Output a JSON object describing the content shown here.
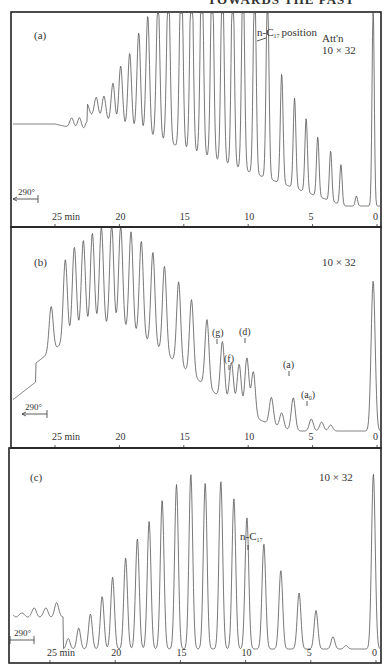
{
  "header": {
    "running_title": "TOWARDS THE PAST"
  },
  "chart_data": [
    {
      "type": "line",
      "panel": "(a)",
      "title": "",
      "xlabel": "min",
      "ylabel": "",
      "x_direction": "reversed",
      "xlim": [
        28,
        0
      ],
      "x_ticks": [
        25,
        20,
        15,
        10,
        5,
        0
      ],
      "x_tick_labels": [
        "25 min",
        "20",
        "15",
        "10",
        "5",
        "0"
      ],
      "grid": false,
      "annotations": [
        {
          "text": "n-C17 position",
          "x_min": 9.5
        },
        {
          "text": "Att'n",
          "role": "attenuation-label"
        },
        {
          "text": "10 × 32",
          "role": "attenuation"
        },
        {
          "text": "290°",
          "role": "temperature-hold-arrow"
        }
      ],
      "baseline_start": 0.55,
      "peaks_min": [
        23.7,
        23.1,
        22.5,
        21.8,
        21.2,
        20.5,
        19.9,
        19.2,
        18.5,
        17.8,
        17.0,
        16.2,
        15.2,
        14.4,
        13.6,
        12.8,
        12.0,
        11.2,
        10.4,
        9.5,
        8.5,
        7.4,
        6.4,
        5.5,
        4.6,
        3.6,
        2.8,
        1.6,
        0.3
      ],
      "peak_heights_norm": [
        0.05,
        0.06,
        0.05,
        0.1,
        0.12,
        0.2,
        0.3,
        0.38,
        0.5,
        0.6,
        0.72,
        0.82,
        1.0,
        1.0,
        1.0,
        1.0,
        1.0,
        1.0,
        1.0,
        1.0,
        0.95,
        0.55,
        0.45,
        0.37,
        0.3,
        0.25,
        0.2,
        0.05,
        1.0
      ]
    },
    {
      "type": "line",
      "panel": "(b)",
      "xlabel": "min",
      "x_direction": "reversed",
      "xlim": [
        28,
        0
      ],
      "x_ticks": [
        25,
        20,
        15,
        10,
        5,
        0
      ],
      "x_tick_labels": [
        "25 min",
        "20",
        "15",
        "10",
        "5",
        "0"
      ],
      "grid": false,
      "annotations": [
        {
          "text": "10 × 32",
          "role": "attenuation"
        },
        {
          "text": "(g)",
          "x_min": 12.0
        },
        {
          "text": "(f)",
          "x_min": 11.3
        },
        {
          "text": "(d)",
          "x_min": 10.1
        },
        {
          "text": "(a)",
          "x_min": 6.5
        },
        {
          "text": "(a0)",
          "x_min": 5.1
        },
        {
          "text": "290°",
          "role": "temperature-hold-arrow"
        }
      ],
      "envelope": "broad unresolved hump peaking ~20–21 min, declining toward 0",
      "peaks_min": [
        25.3,
        24.2,
        23.5,
        22.8,
        22.1,
        21.4,
        20.6,
        19.9,
        19.1,
        18.3,
        17.4,
        16.5,
        15.4,
        14.4,
        13.2,
        12.0,
        11.3,
        10.7,
        10.1,
        9.6,
        8.2,
        7.4,
        6.5,
        5.1,
        4.3,
        3.6,
        0.3
      ],
      "peak_heights_norm": [
        0.3,
        0.55,
        0.6,
        0.62,
        0.65,
        0.68,
        0.7,
        0.7,
        0.68,
        0.65,
        0.62,
        0.58,
        0.55,
        0.5,
        0.45,
        0.38,
        0.28,
        0.3,
        0.37,
        0.3,
        0.18,
        0.1,
        0.22,
        0.08,
        0.06,
        0.04,
        1.0
      ]
    },
    {
      "type": "line",
      "panel": "(c)",
      "xlabel": "min",
      "x_direction": "reversed",
      "xlim": [
        28,
        0
      ],
      "x_ticks": [
        25,
        20,
        15,
        10,
        5,
        0
      ],
      "x_tick_labels": [
        "25 min",
        "20",
        "15",
        "10",
        "5",
        "0"
      ],
      "grid": false,
      "annotations": [
        {
          "text": "10 × 32",
          "role": "attenuation"
        },
        {
          "text": "n-C17",
          "x_min": 9.9
        },
        {
          "text": "290°",
          "role": "temperature-hold-arrow"
        }
      ],
      "peaks_min": [
        26.2,
        25.3,
        24.5,
        23.6,
        22.8,
        21.9,
        21.0,
        20.2,
        19.2,
        18.3,
        17.4,
        16.4,
        15.3,
        14.2,
        13.1,
        11.9,
        10.9,
        9.9,
        8.6,
        7.3,
        5.9,
        4.6,
        3.3,
        2.3,
        0.2
      ],
      "peak_heights_norm": [
        0.03,
        0.03,
        0.06,
        0.06,
        0.12,
        0.2,
        0.3,
        0.41,
        0.52,
        0.63,
        0.73,
        0.85,
        0.94,
        1.0,
        0.95,
        0.96,
        0.86,
        0.75,
        0.6,
        0.45,
        0.32,
        0.22,
        0.07,
        0.02,
        1.0
      ]
    }
  ],
  "panels": [
    {
      "label": "(a)",
      "att_label": "Att'n",
      "att_value": "10 × 32",
      "temp": "290°",
      "note": "position",
      "note_prefix": "n-C",
      "note_sub": "17"
    },
    {
      "label": "(b)",
      "att_value": "10 × 32",
      "temp": "290°",
      "markers": [
        "(g)",
        "(f)",
        "(d)",
        "(a)",
        "(a"
      ],
      "marker_sub": "0"
    },
    {
      "label": "(c)",
      "att_value": "10 × 32",
      "temp": "290°",
      "note_prefix": "n-C",
      "note_sub": "17"
    }
  ],
  "axis": {
    "tick_labels": [
      "25 min",
      "20",
      "15",
      "10",
      "5",
      "0"
    ]
  }
}
